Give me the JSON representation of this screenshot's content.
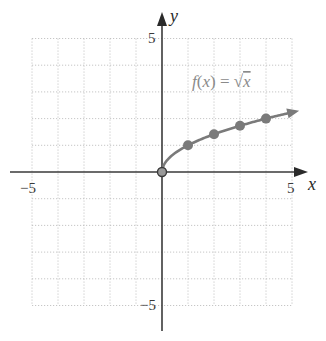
{
  "chart_data": {
    "type": "line",
    "title": "",
    "function_label": "f(x) = √x",
    "xlabel": "x",
    "ylabel": "y",
    "xlim": [
      -5,
      5
    ],
    "ylim": [
      -5,
      5
    ],
    "grid": true,
    "grid_style": "dotted",
    "x_tick_labels": [
      "-5",
      "5"
    ],
    "y_tick_labels": [
      "5",
      "-5"
    ],
    "series": [
      {
        "name": "f(x) = √x",
        "curve_domain": [
          0,
          4.9
        ],
        "arrow_end": true,
        "x": [
          0,
          1,
          2,
          3,
          4
        ],
        "values": [
          0,
          1,
          1.41,
          1.73,
          2
        ],
        "marked_points": [
          [
            1,
            1
          ],
          [
            2,
            1.41
          ],
          [
            3,
            1.73
          ],
          [
            4,
            2
          ]
        ],
        "origin_point": [
          0,
          0
        ],
        "color": "#7a7a7a"
      }
    ]
  },
  "labels": {
    "x_axis": "x",
    "y_axis": "y",
    "x_min": "−5",
    "x_max": "5",
    "y_max": "5",
    "y_min": "−5",
    "fn_f": "f",
    "fn_open": "(",
    "fn_x": "x",
    "fn_close": ")",
    "fn_eq": " = ",
    "fn_sqrt": "√",
    "fn_arg": "x"
  },
  "colors": {
    "axis": "#3a3a3a",
    "grid": "#b8b8b8",
    "curve": "#7a7a7a",
    "points": "#7a7a7a"
  }
}
